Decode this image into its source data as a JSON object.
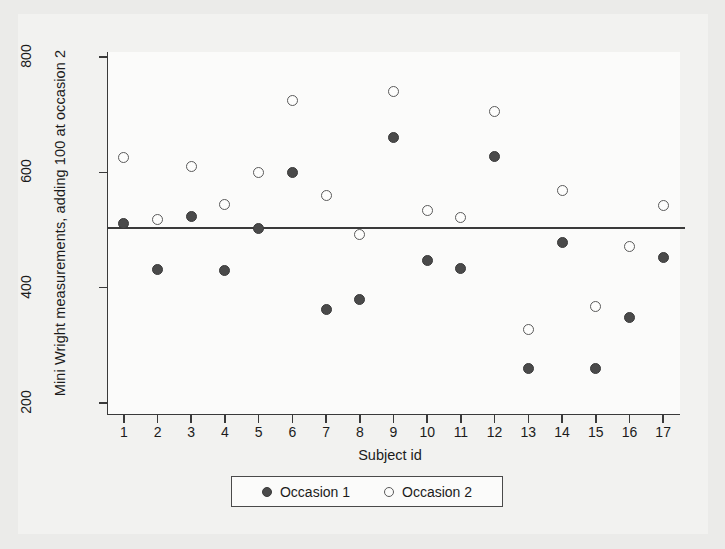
{
  "chart_data": {
    "type": "scatter",
    "title": "",
    "xlabel": "Subject id",
    "ylabel": "Mini Wright measurements, adding 100 at occasion 2",
    "xlim": [
      0.5,
      17.5
    ],
    "ylim": [
      200,
      820
    ],
    "xticks": [
      "1",
      "2",
      "3",
      "4",
      "5",
      "6",
      "7",
      "8",
      "9",
      "10",
      "11",
      "12",
      "13",
      "14",
      "15",
      "16",
      "17"
    ],
    "yticks": [
      "200",
      "400",
      "600",
      "800"
    ],
    "grid": false,
    "legend_position": "below-plot",
    "categories": [
      1,
      2,
      3,
      4,
      5,
      6,
      7,
      8,
      9,
      10,
      11,
      12,
      13,
      14,
      15,
      16,
      17
    ],
    "series": [
      {
        "name": "Occasion 1",
        "marker": "filled-circle",
        "color": "#4a4a4a",
        "values": [
          512,
          432,
          523,
          430,
          503,
          600,
          363,
          380,
          660,
          447,
          434,
          627,
          260,
          478,
          260,
          348,
          452
        ]
      },
      {
        "name": "Occasion 2",
        "marker": "open-circle",
        "color": "#5a5a5a",
        "values": [
          625,
          518,
          610,
          545,
          600,
          725,
          560,
          492,
          740,
          533,
          522,
          705,
          328,
          568,
          368,
          472,
          542
        ]
      }
    ],
    "reference_line": {
      "orientation": "horizontal",
      "value": 504,
      "color": "#3a3a3a"
    }
  },
  "legend": {
    "entries": [
      {
        "label": "Occasion 1",
        "marker": "filled-circle"
      },
      {
        "label": "Occasion 2",
        "marker": "open-circle"
      }
    ]
  }
}
